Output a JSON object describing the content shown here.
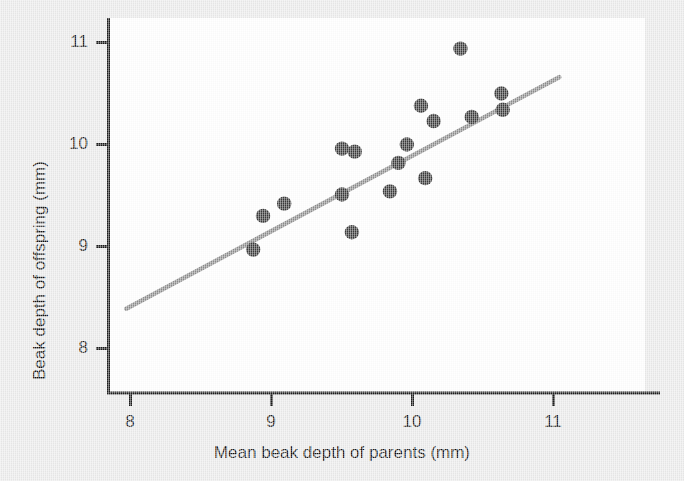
{
  "figure": {
    "background_color": "#ebebeb",
    "plot_background_color": "#ffffff",
    "axis_color": "#1a1a1a",
    "point_color": "#3a3a3a",
    "line_color": "#8d8d8d"
  },
  "axes": {
    "x_title": "Mean beak depth of parents (mm)",
    "y_title": "Beak depth of offspring (mm)",
    "x_ticks": [
      "8",
      "9",
      "10",
      "11"
    ],
    "y_ticks": [
      "11",
      "10",
      "9",
      "8"
    ]
  },
  "chart_data": {
    "type": "scatter",
    "title": "",
    "xlabel": "Mean beak depth of parents (mm)",
    "ylabel": "Beak depth of offspring (mm)",
    "xlim": [
      7.85,
      11.15
    ],
    "ylim": [
      7.55,
      11.25
    ],
    "xticks": [
      8,
      9,
      10,
      11
    ],
    "yticks": [
      8,
      9,
      10,
      11
    ],
    "grid": false,
    "legend": null,
    "series": [
      {
        "name": "Darwin's finch parent-offspring beak depth",
        "marker": "filled-circle",
        "color": "#3a3a3a",
        "points": [
          {
            "x": 8.87,
            "y": 8.97
          },
          {
            "x": 8.94,
            "y": 9.3
          },
          {
            "x": 9.09,
            "y": 9.42
          },
          {
            "x": 9.5,
            "y": 9.51
          },
          {
            "x": 9.5,
            "y": 9.96
          },
          {
            "x": 9.59,
            "y": 9.93
          },
          {
            "x": 9.57,
            "y": 9.14
          },
          {
            "x": 9.84,
            "y": 9.54
          },
          {
            "x": 9.9,
            "y": 9.82
          },
          {
            "x": 9.96,
            "y": 10.0
          },
          {
            "x": 10.09,
            "y": 9.67
          },
          {
            "x": 10.06,
            "y": 10.38
          },
          {
            "x": 10.15,
            "y": 10.23
          },
          {
            "x": 10.34,
            "y": 10.94
          },
          {
            "x": 10.42,
            "y": 10.27
          },
          {
            "x": 10.63,
            "y": 10.5
          },
          {
            "x": 10.64,
            "y": 10.34
          }
        ]
      }
    ],
    "trendline": {
      "name": "regression line",
      "color": "#8d8d8d",
      "x_start": 7.97,
      "y_start": 8.39,
      "x_end": 11.04,
      "y_end": 10.66
    }
  }
}
